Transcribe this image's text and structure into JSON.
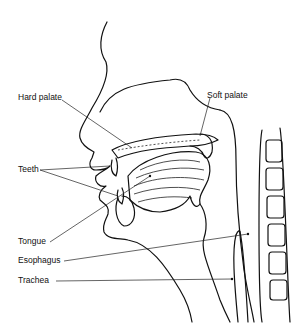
{
  "diagram": {
    "type": "anatomical-line-drawing",
    "labels": [
      {
        "id": "hard_palate",
        "text": "Hard palate"
      },
      {
        "id": "soft_palate",
        "text": "Soft palate"
      },
      {
        "id": "teeth",
        "text": "Teeth"
      },
      {
        "id": "tongue",
        "text": "Tongue"
      },
      {
        "id": "esophagus",
        "text": "Esophagus"
      },
      {
        "id": "trachea",
        "text": "Trachea"
      }
    ]
  }
}
